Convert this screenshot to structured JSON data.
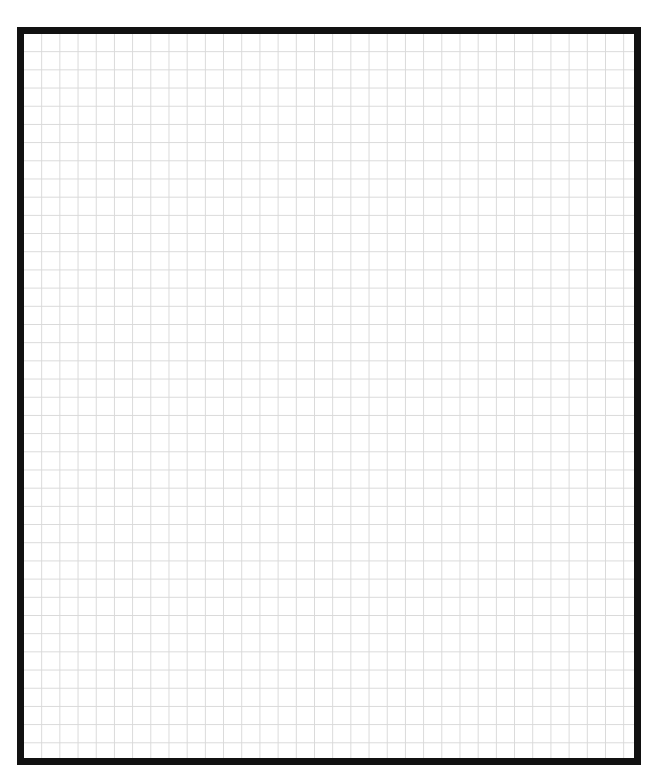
{
  "canvas": {
    "kind": "graph-paper",
    "border_color": "#111111",
    "grid_color": "#d9d9d9",
    "background_color": "#ffffff"
  }
}
